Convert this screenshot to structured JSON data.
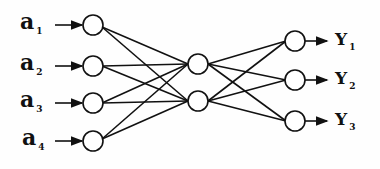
{
  "diagram": {
    "type": "neural-network",
    "layers": [
      {
        "name": "input",
        "size": 4
      },
      {
        "name": "hidden",
        "size": 2
      },
      {
        "name": "output",
        "size": 3
      }
    ],
    "inputs": [
      {
        "main": "a",
        "sub": "1"
      },
      {
        "main": "a",
        "sub": "2"
      },
      {
        "main": "a",
        "sub": "3"
      },
      {
        "main": "a",
        "sub": "4"
      }
    ],
    "outputs": [
      {
        "main": "Y",
        "sub": "1"
      },
      {
        "main": "Y",
        "sub": "2"
      },
      {
        "main": "Y",
        "sub": "3"
      }
    ],
    "colors": {
      "stroke": "#111111",
      "node_fill": "#ffffff"
    }
  }
}
